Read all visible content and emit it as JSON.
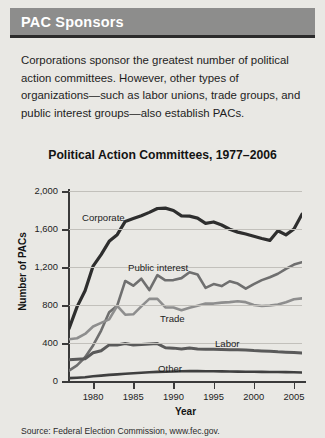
{
  "header": {
    "title": "PAC Sponsors"
  },
  "intro": {
    "text": "Corporations sponsor the greatest number of political action committees. However, other types of organizations—such as labor unions, trade groups, and public interest groups—also establish PACs."
  },
  "source": {
    "text": "Source: Federal Election Commission, www.fec.gov."
  },
  "colors": {
    "header_band": "#8d8d8c",
    "header_rule": "#2b2b2b",
    "page_background": "#e9e8e4",
    "corporate": "#2e2e2e",
    "public_interest": "#6f6f6f",
    "trade": "#8e8e8e",
    "labor": "#5a5a5a",
    "other": "#3f3f3f",
    "gridline": "#c2c0bb",
    "axis": "#3a3a3a"
  },
  "chart_data": {
    "type": "line",
    "title": "Political Action Committees, 1977–2006",
    "xlabel": "Year",
    "ylabel": "Number of PACs",
    "xlim": [
      1977,
      2006
    ],
    "ylim": [
      0,
      2000
    ],
    "grid": true,
    "legend_position": "inline-labels",
    "xticks": [
      "1980",
      "1985",
      "1990",
      "1995",
      "2000",
      "2005"
    ],
    "xtick_values": [
      1980,
      1985,
      1990,
      1995,
      2000,
      2005
    ],
    "yticks": [
      "0",
      "400",
      "800",
      "1,200",
      "1,600",
      "2,000"
    ],
    "ytick_values": [
      0,
      400,
      800,
      1200,
      1600,
      2000
    ],
    "x": [
      1977,
      1978,
      1979,
      1980,
      1981,
      1982,
      1983,
      1984,
      1985,
      1986,
      1987,
      1988,
      1989,
      1990,
      1991,
      1992,
      1993,
      1994,
      1995,
      1996,
      1997,
      1998,
      1999,
      2000,
      2001,
      2002,
      2003,
      2004,
      2005,
      2006
    ],
    "series": [
      {
        "name": "Corporate",
        "label": "Corporate",
        "color": "#2e2e2e",
        "values": [
          550,
          780,
          950,
          1210,
          1330,
          1470,
          1540,
          1680,
          1710,
          1740,
          1775,
          1816,
          1820,
          1795,
          1738,
          1735,
          1715,
          1660,
          1674,
          1642,
          1597,
          1567,
          1548,
          1523,
          1500,
          1480,
          1582,
          1538,
          1600,
          1755
        ]
      },
      {
        "name": "Public interest",
        "label": "Public interest",
        "color": "#6f6f6f",
        "values": [
          110,
          165,
          250,
          374,
          531,
          723,
          793,
          1053,
          1003,
          1077,
          957,
          1115,
          1060,
          1062,
          1083,
          1145,
          1121,
          980,
          1020,
          999,
          1050,
          1026,
          972,
          1020,
          1062,
          1092,
          1129,
          1180,
          1225,
          1250
        ]
      },
      {
        "name": "Trade",
        "label": "Trade",
        "color": "#8e8e8e",
        "values": [
          440,
          450,
          495,
          574,
          612,
          649,
          792,
          698,
          702,
          786,
          865,
          865,
          775,
          774,
          745,
          770,
          792,
          815,
          815,
          825,
          830,
          840,
          830,
          800,
          790,
          795,
          805,
          830,
          860,
          870
        ]
      },
      {
        "name": "Labor",
        "label": "Labor",
        "color": "#5a5a5a",
        "values": [
          225,
          230,
          235,
          297,
          318,
          380,
          378,
          394,
          380,
          384,
          390,
          394,
          350,
          346,
          338,
          347,
          337,
          333,
          334,
          332,
          330,
          328,
          326,
          320,
          316,
          313,
          307,
          303,
          300,
          295
        ]
      },
      {
        "name": "Other",
        "label": "Other",
        "color": "#3f3f3f",
        "values": [
          30,
          35,
          40,
          50,
          57,
          64,
          70,
          77,
          82,
          87,
          92,
          96,
          98,
          100,
          102,
          104,
          105,
          103,
          102,
          101,
          100,
          99,
          98,
          97,
          96,
          95,
          94,
          93,
          92,
          90
        ]
      }
    ]
  }
}
